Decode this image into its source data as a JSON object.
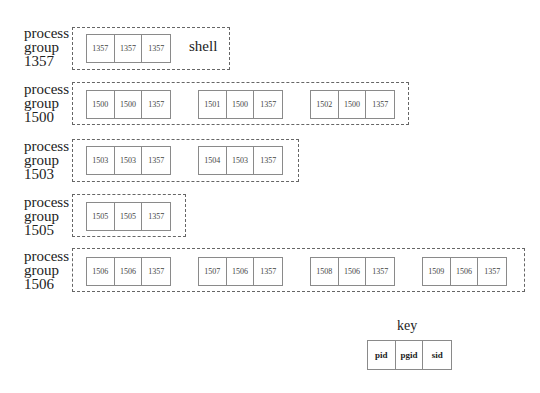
{
  "groups": [
    {
      "label": [
        "process",
        "group",
        "1357"
      ],
      "annotation": "shell",
      "processes": [
        {
          "pid": "1357",
          "pgid": "1357",
          "sid": "1357"
        }
      ]
    },
    {
      "label": [
        "process",
        "group",
        "1500"
      ],
      "processes": [
        {
          "pid": "1500",
          "pgid": "1500",
          "sid": "1357"
        },
        {
          "pid": "1501",
          "pgid": "1500",
          "sid": "1357"
        },
        {
          "pid": "1502",
          "pgid": "1500",
          "sid": "1357"
        }
      ]
    },
    {
      "label": [
        "process",
        "group",
        "1503"
      ],
      "processes": [
        {
          "pid": "1503",
          "pgid": "1503",
          "sid": "1357"
        },
        {
          "pid": "1504",
          "pgid": "1503",
          "sid": "1357"
        }
      ]
    },
    {
      "label": [
        "process",
        "group",
        "1505"
      ],
      "processes": [
        {
          "pid": "1505",
          "pgid": "1505",
          "sid": "1357"
        }
      ]
    },
    {
      "label": [
        "process",
        "group",
        "1506"
      ],
      "processes": [
        {
          "pid": "1506",
          "pgid": "1506",
          "sid": "1357"
        },
        {
          "pid": "1507",
          "pgid": "1506",
          "sid": "1357"
        },
        {
          "pid": "1508",
          "pgid": "1506",
          "sid": "1357"
        },
        {
          "pid": "1509",
          "pgid": "1506",
          "sid": "1357"
        }
      ]
    }
  ],
  "key": {
    "title": "key",
    "fields": [
      "pid",
      "pgid",
      "sid"
    ]
  }
}
